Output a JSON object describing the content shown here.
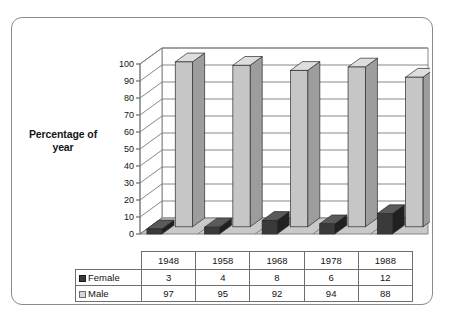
{
  "chart_data": {
    "type": "bar",
    "title": "",
    "subtitle": "",
    "xlabel": "",
    "ylabel": "Percentage of year",
    "ylim": [
      0,
      100
    ],
    "ytick_step": 10,
    "yticks": [
      "0",
      "10",
      "20",
      "30",
      "40",
      "50",
      "60",
      "70",
      "80",
      "90",
      "100"
    ],
    "categories": [
      "1948",
      "1958",
      "1968",
      "1978",
      "1988"
    ],
    "grid": true,
    "legend_position": "data-table",
    "style": "3d-column",
    "series": [
      {
        "name": "Female",
        "values": [
          3,
          4,
          8,
          6,
          12
        ],
        "color": "#3a3a3a"
      },
      {
        "name": "Male",
        "values": [
          97,
          95,
          92,
          94,
          88
        ],
        "color": "#c6c6c6"
      }
    ]
  },
  "axis": {
    "y_title_line1": "Percentage of",
    "y_title_line2": "year"
  },
  "table": {
    "year_header": [
      "1948",
      "1958",
      "1968",
      "1978",
      "1988"
    ],
    "rows": [
      {
        "label": "Female",
        "swatch": "dark-swatch-icon",
        "values": [
          "3",
          "4",
          "8",
          "6",
          "12"
        ]
      },
      {
        "label": "Male",
        "swatch": "light-swatch-icon",
        "values": [
          "97",
          "95",
          "92",
          "94",
          "88"
        ]
      }
    ]
  },
  "colors": {
    "frame_border": "#8a8a8a",
    "grid": "#7a7a7a",
    "floor": "#c9c9c9",
    "male_front": "#c6c6c6",
    "male_side": "#9d9d9d",
    "male_top": "#dedede",
    "female_front": "#3a3a3a",
    "female_side": "#202020",
    "female_top": "#5a5a5a",
    "text": "#131313"
  }
}
